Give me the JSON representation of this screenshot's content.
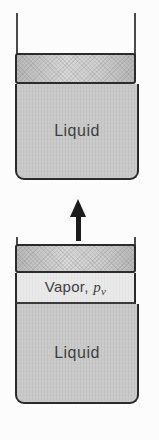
{
  "figure": {
    "description_colors": {
      "background": "#fcfcfc",
      "liquid_fill": "#c9c9c9",
      "vapor_fill": "#e9e9e9",
      "piston_fill_gradient": [
        "#b9b9b9",
        "#d9d9d9"
      ],
      "outline": "#2b2b2b",
      "label_text": "#3f3f3f",
      "arrow": "#1c1c1c"
    },
    "icons": {
      "piston_motion_arrow": "up-arrow"
    },
    "top_container": {
      "liquid_label": "Liquid"
    },
    "bottom_container": {
      "vapor_label_prefix": "Vapor, ",
      "vapor_pressure_symbol": "p",
      "vapor_pressure_subscript": "v",
      "liquid_label": "Liquid"
    }
  }
}
